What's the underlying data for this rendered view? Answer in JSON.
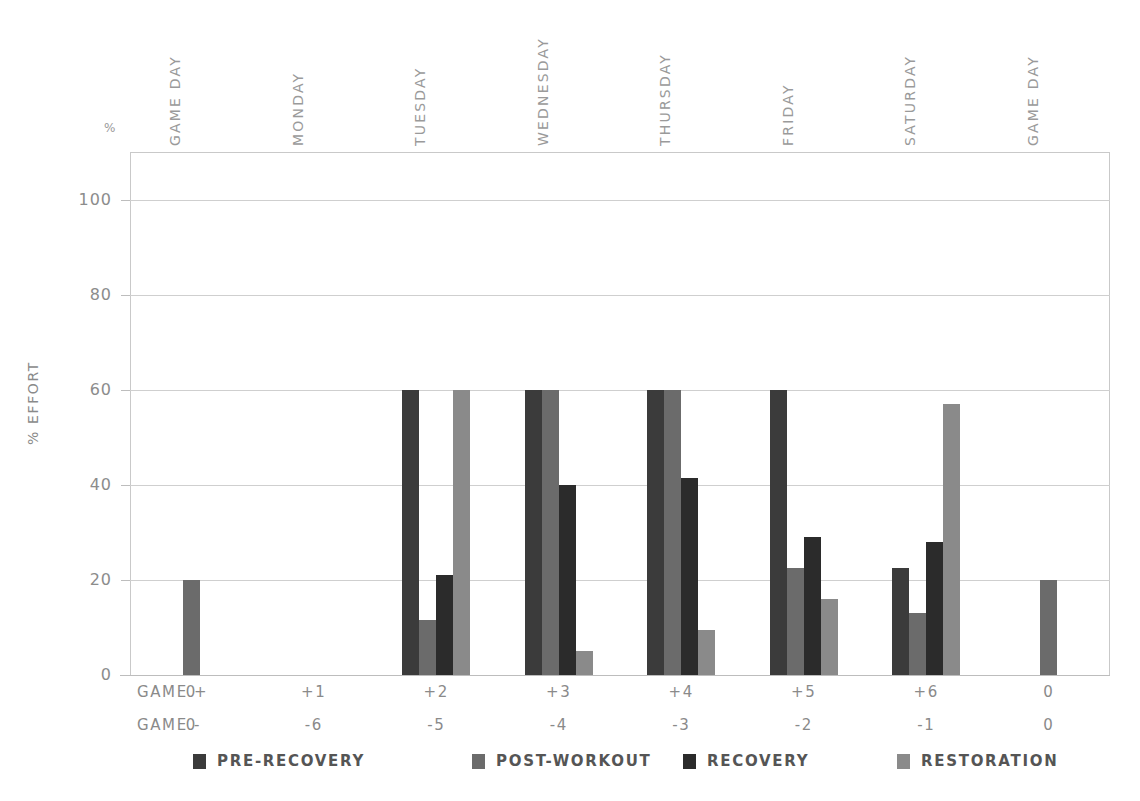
{
  "chart_data": {
    "type": "bar",
    "title": "",
    "xlabel": "",
    "ylabel": "% EFFORT",
    "ylim": [
      0,
      110
    ],
    "yticks": [
      0,
      20,
      40,
      60,
      80,
      100
    ],
    "unit_marker": "%",
    "grid": true,
    "legend_position": "bottom",
    "categories": [
      "GAME DAY",
      "MONDAY",
      "TUESDAY",
      "WEDNESDAY",
      "THURSDAY",
      "FRIDAY",
      "SATURDAY",
      "GAME DAY"
    ],
    "series": [
      {
        "name": "PRE-RECOVERY",
        "color": "#3b3b3b",
        "values": [
          null,
          null,
          60,
          60,
          60,
          60,
          22.5,
          null
        ]
      },
      {
        "name": "POST-WORKOUT",
        "color": "#6b6b6b",
        "values": [
          20,
          null,
          11.5,
          60,
          60,
          22.5,
          13,
          20
        ]
      },
      {
        "name": "RECOVERY",
        "color": "#2b2b2b",
        "values": [
          null,
          null,
          21,
          40,
          41.5,
          29,
          28,
          null
        ]
      },
      {
        "name": "RESTORATION",
        "color": "#8a8a8a",
        "values": [
          null,
          null,
          60,
          5,
          9.5,
          16,
          57,
          null
        ]
      }
    ],
    "axis_rows": [
      {
        "label": "GAME +",
        "values": [
          "0",
          "+1",
          "+2",
          "+3",
          "+4",
          "+5",
          "+6",
          "0"
        ]
      },
      {
        "label": "GAME -",
        "values": [
          "0",
          "-6",
          "-5",
          "-4",
          "-3",
          "-2",
          "-1",
          "0"
        ]
      }
    ]
  },
  "colors": {
    "pre_recovery": "#3b3b3b",
    "post_workout": "#6b6b6b",
    "recovery": "#2b2b2b",
    "restoration": "#8a8a8a",
    "grid": "#cfcfcf",
    "axis": "#bdbdbd",
    "text": "#8a8a8a"
  },
  "legend": {
    "items": [
      {
        "label": "PRE-RECOVERY",
        "color": "#3b3b3b"
      },
      {
        "label": "POST-WORKOUT",
        "color": "#6b6b6b"
      },
      {
        "label": "RECOVERY",
        "color": "#2b2b2b"
      },
      {
        "label": "RESTORATION",
        "color": "#8a8a8a"
      }
    ]
  },
  "y_axis": {
    "unit": "%",
    "title": "% EFFORT",
    "ticks": [
      "100",
      "80",
      "60",
      "40",
      "20",
      "0"
    ]
  }
}
